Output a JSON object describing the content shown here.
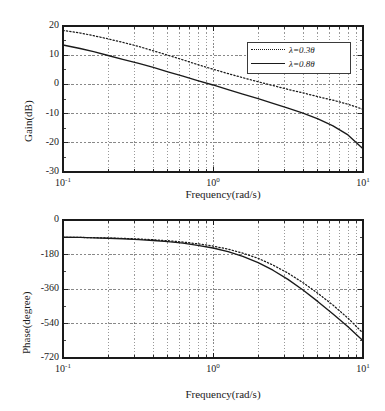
{
  "figure": {
    "background": "#ffffff",
    "line_color": "#1a1a1a",
    "grid_color": "#555555"
  },
  "chart_data": [
    {
      "type": "line",
      "id": "magnitude",
      "title": "",
      "xlabel": "Frequency(rad/s)",
      "ylabel": "Gain(dB)",
      "xscale": "log",
      "xlim": [
        0.1,
        10
      ],
      "ylim": [
        -30,
        20
      ],
      "yticks": [
        20,
        10,
        0,
        -10,
        -20,
        -30
      ],
      "ytick_labels": [
        "20",
        "10",
        "0",
        "-10",
        "-20",
        "-30"
      ],
      "xticks": [
        0.1,
        1,
        10
      ],
      "xtick_labels": [
        "10-1",
        "100",
        "101"
      ],
      "xtick_mantissa": [
        "10",
        "10",
        "10"
      ],
      "xtick_exponent": [
        "-1",
        "0",
        "1"
      ],
      "grid": true,
      "legend_position": "upper right",
      "series": [
        {
          "name": "lambda=0.3theta",
          "label_prefix": "λ=0.3",
          "label_suffix": "θ",
          "style": "dotted",
          "x": [
            0.1,
            0.13,
            0.16,
            0.2,
            0.25,
            0.32,
            0.4,
            0.5,
            0.63,
            0.79,
            1.0,
            1.26,
            1.58,
            2.0,
            2.51,
            3.16,
            3.98,
            5.01,
            6.31,
            7.94,
            10.0
          ],
          "y": [
            18.5,
            17.6,
            16.7,
            15.6,
            14.4,
            13.0,
            11.5,
            10.0,
            8.4,
            6.8,
            5.2,
            3.7,
            2.3,
            0.9,
            -0.4,
            -1.7,
            -2.9,
            -4.2,
            -5.4,
            -6.8,
            -8.5
          ]
        },
        {
          "name": "lambda=0.8theta",
          "label_prefix": "λ=0.8",
          "label_suffix": "θ",
          "style": "solid",
          "x": [
            0.1,
            0.13,
            0.16,
            0.2,
            0.25,
            0.32,
            0.4,
            0.5,
            0.63,
            0.79,
            1.0,
            1.26,
            1.58,
            2.0,
            2.51,
            3.16,
            3.98,
            5.01,
            6.31,
            7.94,
            10.0
          ],
          "y": [
            13.5,
            12.3,
            11.2,
            9.9,
            8.6,
            7.2,
            5.8,
            4.3,
            2.8,
            1.3,
            -0.2,
            -1.8,
            -3.3,
            -4.9,
            -6.5,
            -8.1,
            -9.8,
            -11.8,
            -14.2,
            -17.3,
            -22.0
          ]
        }
      ]
    },
    {
      "type": "line",
      "id": "phase",
      "title": "",
      "xlabel": "Frequency(rad/s)",
      "ylabel": "Phase(degree)",
      "xscale": "log",
      "xlim": [
        0.1,
        10
      ],
      "ylim": [
        -720,
        0
      ],
      "yticks": [
        0,
        -180,
        -360,
        -540,
        -720
      ],
      "ytick_labels": [
        "0",
        "-180",
        "-360",
        "-540",
        "-720"
      ],
      "xticks": [
        0.1,
        1,
        10
      ],
      "xtick_labels": [
        "10-1",
        "100",
        "101"
      ],
      "xtick_mantissa": [
        "10",
        "10",
        "10"
      ],
      "xtick_exponent": [
        "-1",
        "0",
        "1"
      ],
      "grid": true,
      "legend_position": "none",
      "series": [
        {
          "name": "lambda=0.3theta",
          "label_prefix": "λ=0.3",
          "label_suffix": "θ",
          "style": "dotted",
          "x": [
            0.1,
            0.13,
            0.16,
            0.2,
            0.25,
            0.32,
            0.4,
            0.5,
            0.63,
            0.79,
            1.0,
            1.26,
            1.58,
            2.0,
            2.51,
            3.16,
            3.98,
            5.01,
            6.31,
            7.94,
            10.0
          ],
          "y": [
            -90,
            -91,
            -92,
            -94,
            -96,
            -99,
            -103,
            -108,
            -115,
            -124,
            -136,
            -152,
            -173,
            -200,
            -235,
            -277,
            -327,
            -383,
            -444,
            -512,
            -590
          ]
        },
        {
          "name": "lambda=0.8theta",
          "label_prefix": "λ=0.8",
          "label_suffix": "θ",
          "style": "solid",
          "x": [
            0.1,
            0.13,
            0.16,
            0.2,
            0.25,
            0.32,
            0.4,
            0.5,
            0.63,
            0.79,
            1.0,
            1.26,
            1.58,
            2.0,
            2.51,
            3.16,
            3.98,
            5.01,
            6.31,
            7.94,
            10.0
          ],
          "y": [
            -90,
            -91,
            -93,
            -95,
            -98,
            -102,
            -107,
            -113,
            -121,
            -132,
            -146,
            -165,
            -190,
            -222,
            -262,
            -310,
            -365,
            -426,
            -490,
            -557,
            -630
          ]
        }
      ]
    }
  ]
}
